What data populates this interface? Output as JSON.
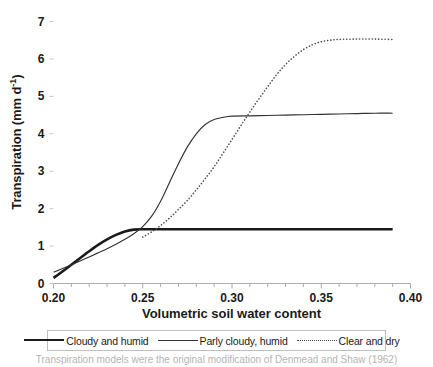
{
  "chart_data": {
    "type": "line",
    "title": "",
    "xlabel": "Volumetric soil water content",
    "ylabel": "Transpiration (mm d-1)",
    "ylabel_base": "Transpiration (mm d",
    "ylabel_sup": "-1",
    "ylabel_close": ")",
    "xlim": [
      0.2,
      0.4
    ],
    "ylim": [
      0,
      7
    ],
    "xticks": [
      "0.20",
      "0.25",
      "0.30",
      "0.35",
      "0.40"
    ],
    "xtick_values": [
      0.2,
      0.25,
      0.3,
      0.35,
      0.4
    ],
    "xminor_step": 0.01,
    "yticks": [
      "0",
      "1",
      "2",
      "3",
      "4",
      "5",
      "6",
      "7"
    ],
    "ytick_values": [
      0,
      1,
      2,
      3,
      4,
      5,
      6,
      7
    ],
    "grid": false,
    "legend_position": "bottom",
    "series": [
      {
        "name": "Cloudy and humid",
        "style": "solid-thick",
        "color": "#1a1a1a",
        "plateau": 1.45,
        "x": [
          0.2,
          0.205,
          0.21,
          0.215,
          0.22,
          0.225,
          0.23,
          0.235,
          0.24,
          0.245,
          0.25,
          0.26,
          0.27,
          0.28,
          0.29,
          0.3,
          0.31,
          0.32,
          0.33,
          0.34,
          0.35,
          0.36,
          0.37,
          0.38,
          0.39
        ],
        "y": [
          0.15,
          0.32,
          0.5,
          0.68,
          0.86,
          1.03,
          1.18,
          1.3,
          1.39,
          1.44,
          1.45,
          1.45,
          1.45,
          1.45,
          1.45,
          1.45,
          1.45,
          1.45,
          1.45,
          1.45,
          1.45,
          1.45,
          1.45,
          1.45,
          1.45
        ]
      },
      {
        "name": "Parly cloudy, humid",
        "style": "solid-thin",
        "color": "#333333",
        "plateau": 4.55,
        "x": [
          0.2,
          0.205,
          0.21,
          0.215,
          0.22,
          0.225,
          0.23,
          0.235,
          0.24,
          0.245,
          0.25,
          0.255,
          0.26,
          0.265,
          0.27,
          0.275,
          0.28,
          0.285,
          0.29,
          0.295,
          0.3,
          0.31,
          0.32,
          0.33,
          0.34,
          0.35,
          0.36,
          0.37,
          0.38,
          0.39
        ],
        "y": [
          0.3,
          0.4,
          0.5,
          0.6,
          0.71,
          0.82,
          0.93,
          1.05,
          1.18,
          1.33,
          1.52,
          1.8,
          2.2,
          2.7,
          3.2,
          3.65,
          4.0,
          4.25,
          4.38,
          4.44,
          4.47,
          4.48,
          4.49,
          4.5,
          4.51,
          4.52,
          4.53,
          4.54,
          4.55,
          4.55
        ]
      },
      {
        "name": "Clear and dry",
        "style": "dotted",
        "color": "#4a4a4a",
        "plateau": 6.5,
        "x": [
          0.25,
          0.255,
          0.26,
          0.265,
          0.27,
          0.275,
          0.28,
          0.285,
          0.29,
          0.295,
          0.3,
          0.305,
          0.31,
          0.315,
          0.32,
          0.325,
          0.33,
          0.335,
          0.34,
          0.345,
          0.35,
          0.355,
          0.36,
          0.37,
          0.38,
          0.39
        ],
        "y": [
          1.24,
          1.38,
          1.55,
          1.75,
          1.98,
          2.22,
          2.5,
          2.8,
          3.12,
          3.48,
          3.85,
          4.22,
          4.58,
          4.93,
          5.26,
          5.58,
          5.85,
          6.07,
          6.25,
          6.38,
          6.46,
          6.5,
          6.52,
          6.53,
          6.53,
          6.52
        ]
      }
    ]
  },
  "legend": {
    "items": [
      {
        "label": "Cloudy and humid",
        "style": "solid-thick"
      },
      {
        "label": "Parly cloudy, humid",
        "style": "solid-thin"
      },
      {
        "label": "Clear and dry",
        "style": "dotted"
      }
    ]
  },
  "caption": {
    "text": "Transpiration models were the original modification of Denmead and Shaw (1962)"
  }
}
